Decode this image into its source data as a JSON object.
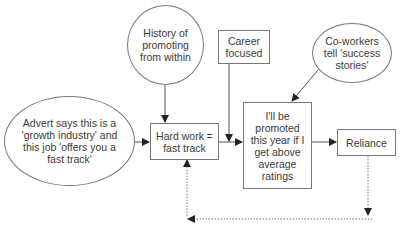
{
  "diagram": {
    "nodes": {
      "advert": {
        "label": "Advert says this is a 'growth industry' and this job 'offers you a fast track'",
        "shape": "oval"
      },
      "history": {
        "label": "History of promoting from within",
        "shape": "oval"
      },
      "career": {
        "label": "Career focused",
        "shape": "box"
      },
      "coworkers": {
        "label": "Co-workers tell 'success stories'",
        "shape": "oval"
      },
      "hardwork": {
        "label": "Hard work = fast track",
        "shape": "box"
      },
      "promoted": {
        "label": "I'll be promoted this year if I get above average ratings",
        "shape": "box"
      },
      "reliance": {
        "label": "Reliance",
        "shape": "box"
      }
    },
    "edges": [
      {
        "from": "advert",
        "to": "hardwork",
        "style": "solid"
      },
      {
        "from": "history",
        "to": "hardwork",
        "style": "solid"
      },
      {
        "from": "career",
        "to": "promoted",
        "style": "solid"
      },
      {
        "from": "hardwork",
        "to": "promoted",
        "style": "solid"
      },
      {
        "from": "coworkers",
        "to": "promoted",
        "style": "solid"
      },
      {
        "from": "promoted",
        "to": "reliance",
        "style": "solid"
      },
      {
        "from": "reliance",
        "to": "hardwork",
        "style": "dotted",
        "note": "feedback loop"
      }
    ],
    "colors": {
      "line": "#555555",
      "border": "#777777",
      "text": "#3a3a3a"
    }
  }
}
